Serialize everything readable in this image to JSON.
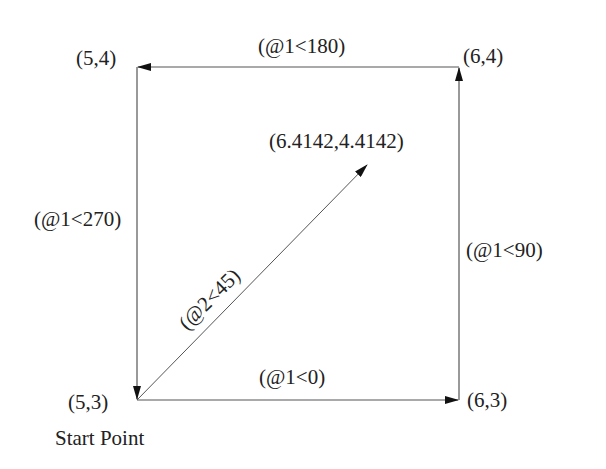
{
  "diagram": {
    "colors": {
      "line": "#555555",
      "arrow": "#111111",
      "text": "#222222"
    },
    "points": [
      {
        "id": "p53",
        "label": "(5,3)",
        "x": 137,
        "y": 400
      },
      {
        "id": "p63",
        "label": "(6,3)",
        "x": 459,
        "y": 400
      },
      {
        "id": "p64",
        "label": "(6,4)",
        "x": 460,
        "y": 67
      },
      {
        "id": "p54",
        "label": "(5,4)",
        "x": 137,
        "y": 67
      },
      {
        "id": "pdiag",
        "label": "(6.4142,4.4142)",
        "x": 367,
        "y": 165
      }
    ],
    "start_label": "Start Point",
    "segments": [
      {
        "id": "seg-0",
        "label": "(@1<0)",
        "from": "(5,3)",
        "to": "(6,3)"
      },
      {
        "id": "seg-90",
        "label": "(@1<90)",
        "from": "(6,3)",
        "to": "(6,4)"
      },
      {
        "id": "seg-180",
        "label": "(@1<180)",
        "from": "(6,4)",
        "to": "(5,4)"
      },
      {
        "id": "seg-270",
        "label": "(@1<270)",
        "from": "(5,4)",
        "to": "(5,3)"
      },
      {
        "id": "seg-45",
        "label": "(@2<45)",
        "from": "(5,3)",
        "to": "(6.4142,4.4142)"
      }
    ]
  }
}
